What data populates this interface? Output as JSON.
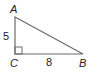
{
  "diagram": {
    "type": "right-triangle",
    "vertices": {
      "A": {
        "label": "A",
        "x": 15,
        "y": 17
      },
      "B": {
        "label": "B",
        "x": 83,
        "y": 54
      },
      "C": {
        "label": "C",
        "x": 15,
        "y": 54
      }
    },
    "sides": {
      "AC": {
        "label": "5"
      },
      "CB": {
        "label": "8"
      }
    },
    "right_angle_at": "C",
    "colors": {
      "stroke": "#6b6b6b",
      "text": "#222222"
    }
  }
}
